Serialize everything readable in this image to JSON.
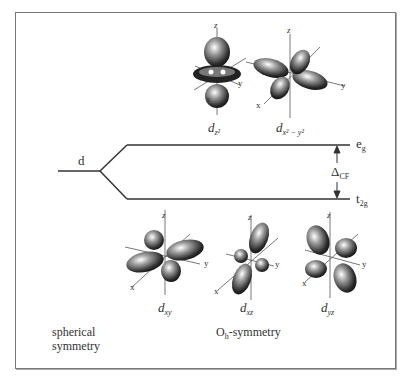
{
  "diagram": {
    "type": "crystal-field-splitting",
    "left_level": {
      "label": "d",
      "caption_line1": "spherical",
      "caption_line2": "symmetry"
    },
    "upper_level": {
      "label_main": "e",
      "label_sub": "g"
    },
    "lower_level": {
      "label_main": "t",
      "label_sub": "2g"
    },
    "gap": {
      "label_main": "Δ",
      "label_sub": "CF"
    },
    "right_caption": {
      "main": "O",
      "sub": "h",
      "rest": "-symmetry"
    },
    "upper_orbitals": [
      {
        "name": "d",
        "sub": "z²",
        "axes": {
          "z": "z",
          "x": "x",
          "y": "y"
        }
      },
      {
        "name": "d",
        "sub": "x² − y²",
        "axes": {
          "z": "z",
          "x": "x",
          "y": "y"
        }
      }
    ],
    "lower_orbitals": [
      {
        "name": "d",
        "sub": "xy",
        "axes": {
          "z": "z",
          "x": "x",
          "y": "y"
        }
      },
      {
        "name": "d",
        "sub": "xz",
        "axes": {
          "z": "z",
          "x": "x",
          "y": "y"
        }
      },
      {
        "name": "d",
        "sub": "yz",
        "axes": {
          "z": "z",
          "x": "x",
          "y": "y"
        }
      }
    ]
  }
}
